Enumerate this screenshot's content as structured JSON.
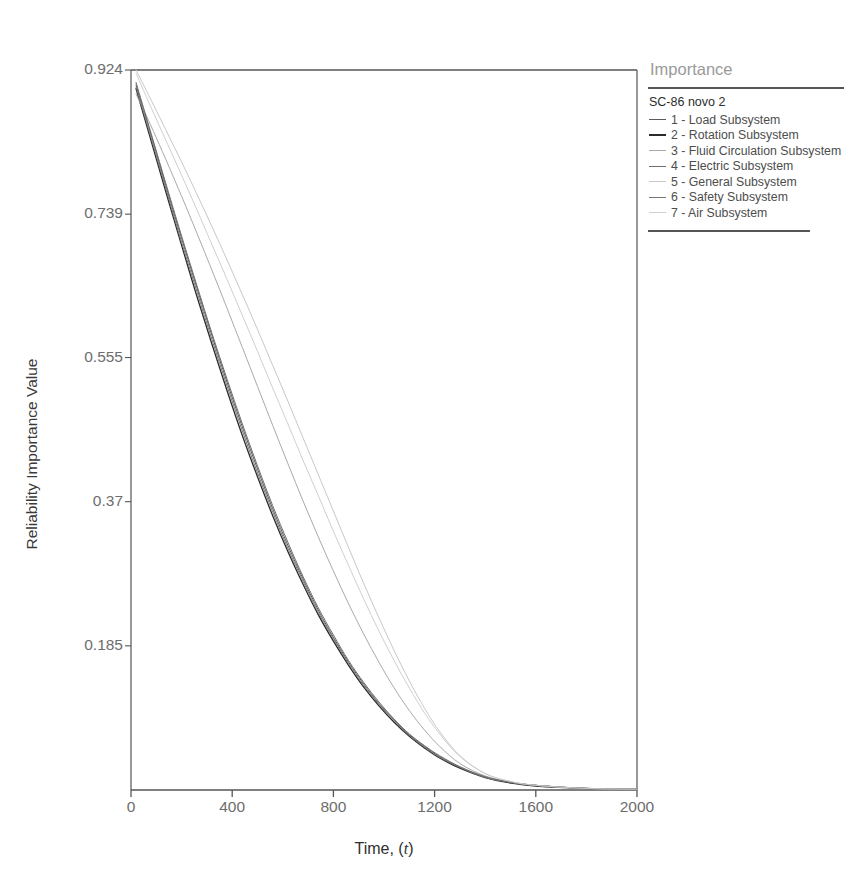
{
  "chart_data": {
    "type": "line",
    "xlabel_prefix": "Time, (",
    "xlabel_italic": "t",
    "xlabel_suffix": ")",
    "ylabel": "Reliability Importance Value",
    "xlim": [
      0,
      2000
    ],
    "ylim": [
      0,
      0.924
    ],
    "grid": false,
    "legend_position": "right",
    "xticks": [
      0,
      400,
      800,
      1200,
      1600,
      2000
    ],
    "xtick_labels": [
      "0",
      "400",
      "800",
      "1200",
      "1600",
      "2000"
    ],
    "yticks": [
      0.185,
      0.37,
      0.555,
      0.739,
      0.924
    ],
    "ytick_labels": [
      "0.185",
      "0.37",
      "0.555",
      "0.739",
      "0.924"
    ],
    "x": [
      20,
      60,
      100,
      150,
      200,
      260,
      320,
      380,
      440,
      500,
      560,
      620,
      680,
      740,
      800,
      860,
      920,
      980,
      1040,
      1100,
      1160,
      1220,
      1300,
      1400,
      1500,
      1600,
      1800,
      2000
    ],
    "series": [
      {
        "name": "1 - Load Subsystem",
        "color": "#5a5a5a",
        "width": 1.0,
        "values": [
          0.905,
          0.862,
          0.818,
          0.762,
          0.708,
          0.645,
          0.583,
          0.523,
          0.466,
          0.412,
          0.361,
          0.314,
          0.271,
          0.231,
          0.196,
          0.164,
          0.136,
          0.111,
          0.09,
          0.071,
          0.056,
          0.043,
          0.029,
          0.017,
          0.01,
          0.006,
          0.002,
          0.001
        ]
      },
      {
        "name": "2 - Rotation Subsystem",
        "color": "#2b2b2b",
        "width": 1.3,
        "values": [
          0.9,
          0.855,
          0.81,
          0.754,
          0.699,
          0.634,
          0.572,
          0.512,
          0.455,
          0.402,
          0.352,
          0.306,
          0.264,
          0.225,
          0.191,
          0.16,
          0.132,
          0.108,
          0.087,
          0.069,
          0.054,
          0.041,
          0.028,
          0.016,
          0.009,
          0.005,
          0.002,
          0.001
        ]
      },
      {
        "name": "3 - Fluid Circulation Subsystem",
        "color": "#a9a9a9",
        "width": 1.0,
        "values": [
          0.893,
          0.866,
          0.837,
          0.8,
          0.762,
          0.715,
          0.667,
          0.618,
          0.568,
          0.518,
          0.468,
          0.419,
          0.371,
          0.325,
          0.281,
          0.239,
          0.2,
          0.164,
          0.131,
          0.102,
          0.077,
          0.056,
          0.034,
          0.018,
          0.01,
          0.006,
          0.002,
          0.001
        ]
      },
      {
        "name": "4 - Electric Subsystem",
        "color": "#6e6e6e",
        "width": 1.0,
        "values": [
          0.908,
          0.864,
          0.82,
          0.765,
          0.711,
          0.648,
          0.586,
          0.527,
          0.47,
          0.416,
          0.365,
          0.318,
          0.274,
          0.234,
          0.199,
          0.166,
          0.138,
          0.113,
          0.091,
          0.072,
          0.057,
          0.044,
          0.03,
          0.017,
          0.01,
          0.006,
          0.002,
          0.001
        ]
      },
      {
        "name": "5 - General Subsystem",
        "color": "#c8c8c8",
        "width": 1.0,
        "values": [
          0.924,
          0.898,
          0.872,
          0.839,
          0.806,
          0.765,
          0.723,
          0.68,
          0.636,
          0.591,
          0.545,
          0.499,
          0.452,
          0.405,
          0.358,
          0.311,
          0.265,
          0.221,
          0.179,
          0.14,
          0.105,
          0.075,
          0.044,
          0.021,
          0.011,
          0.006,
          0.002,
          0.001
        ]
      },
      {
        "name": "6 - Safety Subsystem",
        "color": "#767676",
        "width": 1.0,
        "values": [
          0.902,
          0.858,
          0.814,
          0.758,
          0.703,
          0.64,
          0.578,
          0.518,
          0.461,
          0.407,
          0.357,
          0.31,
          0.268,
          0.228,
          0.194,
          0.162,
          0.134,
          0.11,
          0.089,
          0.07,
          0.055,
          0.042,
          0.029,
          0.016,
          0.01,
          0.006,
          0.002,
          0.001
        ]
      },
      {
        "name": "7 - Air Subsystem",
        "color": "#cfcfcf",
        "width": 1.0,
        "values": [
          0.92,
          0.89,
          0.861,
          0.825,
          0.789,
          0.745,
          0.7,
          0.655,
          0.609,
          0.563,
          0.516,
          0.47,
          0.423,
          0.378,
          0.332,
          0.288,
          0.245,
          0.204,
          0.166,
          0.131,
          0.099,
          0.072,
          0.043,
          0.021,
          0.011,
          0.006,
          0.002,
          0.001
        ]
      }
    ]
  },
  "legend": {
    "title": "Importance",
    "group_label": "SC-86 novo 2"
  },
  "axes": {
    "frame_color": "#555555",
    "tick_color": "#6d6d6d"
  }
}
